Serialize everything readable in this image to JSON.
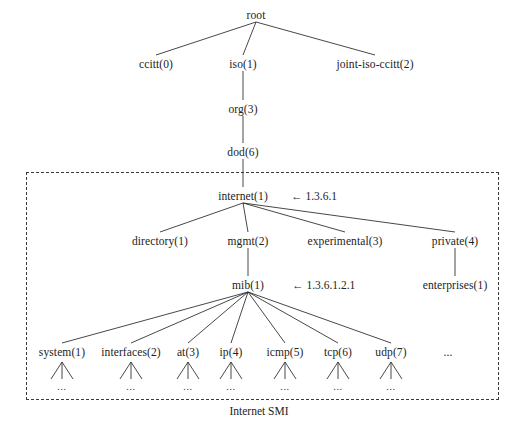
{
  "diagram": {
    "title": "Internet SMI",
    "caption": "Internet SMI",
    "ellipsis": "...",
    "arrow": "←",
    "box": {
      "x": 26,
      "y": 172,
      "width": 471,
      "height": 226
    },
    "nodes": [
      {
        "id": "root",
        "label": "root",
        "x": 256,
        "y": 15
      },
      {
        "id": "ccitt",
        "label": "ccitt(0)",
        "x": 156,
        "y": 64
      },
      {
        "id": "iso",
        "label": "iso(1)",
        "x": 243,
        "y": 64
      },
      {
        "id": "joint-iso-ccitt",
        "label": "joint-iso-ccitt(2)",
        "x": 375,
        "y": 64
      },
      {
        "id": "org",
        "label": "org(3)",
        "x": 243,
        "y": 109
      },
      {
        "id": "dod",
        "label": "dod(6)",
        "x": 243,
        "y": 152
      },
      {
        "id": "internet",
        "label": "internet(1)",
        "x": 243,
        "y": 196
      },
      {
        "id": "directory",
        "label": "directory(1)",
        "x": 160,
        "y": 241
      },
      {
        "id": "mgmt",
        "label": "mgmt(2)",
        "x": 248,
        "y": 241
      },
      {
        "id": "experimental",
        "label": "experimental(3)",
        "x": 345,
        "y": 241
      },
      {
        "id": "private",
        "label": "private(4)",
        "x": 455,
        "y": 241
      },
      {
        "id": "mib",
        "label": "mib(1)",
        "x": 248,
        "y": 285
      },
      {
        "id": "enterprises",
        "label": "enterprises(1)",
        "x": 455,
        "y": 285
      },
      {
        "id": "system",
        "label": "system(1)",
        "x": 62,
        "y": 352
      },
      {
        "id": "interfaces",
        "label": "interfaces(2)",
        "x": 131,
        "y": 352
      },
      {
        "id": "at",
        "label": "at(3)",
        "x": 188,
        "y": 352
      },
      {
        "id": "ip",
        "label": "ip(4)",
        "x": 231,
        "y": 352
      },
      {
        "id": "icmp",
        "label": "icmp(5)",
        "x": 285,
        "y": 352
      },
      {
        "id": "tcp",
        "label": "tcp(6)",
        "x": 338,
        "y": 352
      },
      {
        "id": "udp",
        "label": "udp(7)",
        "x": 391,
        "y": 352
      },
      {
        "id": "more-leaves",
        "label": "...",
        "x": 448,
        "y": 352
      }
    ],
    "annotations": [
      {
        "id": "internet-oid",
        "text": "← 1.3.6.1",
        "x": 291,
        "y": 196
      },
      {
        "id": "mib-oid",
        "text": "← 1.3.6.1.2.1",
        "x": 292,
        "y": 285
      }
    ],
    "edges": [
      {
        "from": "root",
        "to": "ccitt"
      },
      {
        "from": "root",
        "to": "iso"
      },
      {
        "from": "root",
        "to": "joint-iso-ccitt"
      },
      {
        "from": "iso",
        "to": "org"
      },
      {
        "from": "org",
        "to": "dod"
      },
      {
        "from": "dod",
        "to": "internet"
      },
      {
        "from": "internet",
        "to": "directory"
      },
      {
        "from": "internet",
        "to": "mgmt"
      },
      {
        "from": "internet",
        "to": "experimental"
      },
      {
        "from": "internet",
        "to": "private"
      },
      {
        "from": "mgmt",
        "to": "mib"
      },
      {
        "from": "private",
        "to": "enterprises"
      },
      {
        "from": "mib",
        "to": "system"
      },
      {
        "from": "mib",
        "to": "interfaces"
      },
      {
        "from": "mib",
        "to": "at"
      },
      {
        "from": "mib",
        "to": "ip"
      },
      {
        "from": "mib",
        "to": "icmp"
      },
      {
        "from": "mib",
        "to": "tcp"
      },
      {
        "from": "mib",
        "to": "udp"
      }
    ],
    "leaf_fans": [
      {
        "id": "system-fan",
        "x": 62,
        "y": 362
      },
      {
        "id": "interfaces-fan",
        "x": 131,
        "y": 362
      },
      {
        "id": "at-fan",
        "x": 188,
        "y": 362
      },
      {
        "id": "ip-fan",
        "x": 231,
        "y": 362
      },
      {
        "id": "icmp-fan",
        "x": 285,
        "y": 362
      },
      {
        "id": "tcp-fan",
        "x": 338,
        "y": 362
      },
      {
        "id": "udp-fan",
        "x": 391,
        "y": 362
      }
    ],
    "caption_pos": {
      "x": 259,
      "y": 411
    }
  }
}
